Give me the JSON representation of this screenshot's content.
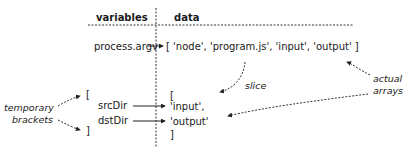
{
  "headers": {
    "variables": "variables",
    "data": "data"
  },
  "rows": {
    "argv_var": "process.argv",
    "argv_data": "[ 'node', 'program.js',  'input', 'output' ]",
    "src_var": "srcDir",
    "dst_var": "dstDir",
    "src_data": "'input',",
    "dst_data": "'output'"
  },
  "brackets": {
    "left_open": "[",
    "left_close": "]",
    "right_open": "[",
    "right_close": "]"
  },
  "annotations": {
    "slice": "slice",
    "actual_line1": "actual",
    "actual_line2": "arrays",
    "temporary_line1": "temporary",
    "temporary_line2": "brackets"
  }
}
